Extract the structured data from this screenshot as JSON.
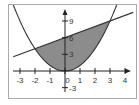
{
  "chart_data": {
    "type": "line",
    "title": "",
    "xlabel": "",
    "ylabel": "",
    "xlim": [
      -3.7,
      4.6
    ],
    "ylim": [
      -4.9,
      12.0
    ],
    "grid": false,
    "x_ticks": [
      -3,
      -2,
      -1,
      0,
      1,
      2,
      3,
      4
    ],
    "x_tick_labels": [
      "-3",
      "-2",
      "-1",
      "0",
      "1",
      "2",
      "3",
      "4"
    ],
    "y_ticks": [
      9,
      6,
      3,
      -3
    ],
    "y_tick_labels": [
      "9",
      "6",
      "3",
      "-3"
    ],
    "series": [
      {
        "name": "parabola",
        "equation": "y = x^2",
        "x": [
          -3.5,
          -3,
          -2,
          -1,
          0,
          1,
          2,
          3,
          3.4
        ],
        "y": [
          12.25,
          9,
          4,
          1,
          0,
          1,
          4,
          9,
          11.56
        ]
      },
      {
        "name": "line",
        "equation": "y = x + 6",
        "x": [
          -3.45,
          4.55
        ],
        "y": [
          2.55,
          10.55
        ]
      }
    ],
    "shaded_region": {
      "between": [
        "line",
        "parabola"
      ],
      "x_from": -2,
      "x_to": 3,
      "intersections": [
        [
          -2,
          4
        ],
        [
          3,
          9
        ]
      ]
    },
    "colors": {
      "shade": "#8c8c8c",
      "curve": "#333333",
      "frame": "#aaaaaa"
    }
  }
}
